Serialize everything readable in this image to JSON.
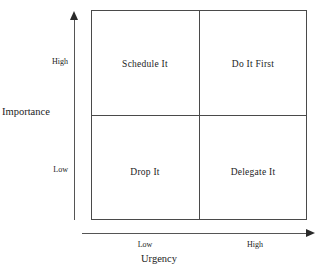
{
  "diagram": {
    "type": "quadrant-matrix",
    "quadrants": [
      {
        "id": "top-left",
        "label": "Schedule It",
        "importance": "High",
        "urgency": "Low"
      },
      {
        "id": "top-right",
        "label": "Do It First",
        "importance": "High",
        "urgency": "High"
      },
      {
        "id": "bottom-left",
        "label": "Drop It",
        "importance": "Low",
        "urgency": "Low"
      },
      {
        "id": "bottom-right",
        "label": "Delegate It",
        "importance": "Low",
        "urgency": "High"
      }
    ],
    "y_axis": {
      "title": "Importance",
      "ticks": {
        "high": "High",
        "low": "Low"
      }
    },
    "x_axis": {
      "title": "Urgency",
      "ticks": {
        "low": "Low",
        "high": "High"
      }
    },
    "colors": {
      "background": "#ffffff",
      "border": "#4a4a4a",
      "axis": "#555555",
      "text": "#1c1c1c"
    }
  }
}
